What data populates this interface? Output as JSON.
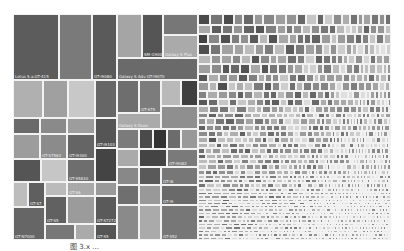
{
  "chart_data": {
    "type": "treemap",
    "title": "",
    "colorscale": "grayscale",
    "big_tiles": [
      {
        "x": 0,
        "y": 0,
        "w": 46,
        "h": 66,
        "c": "#5c5c5c",
        "label": "Lotus S.a.GT-415"
      },
      {
        "x": 46,
        "y": 0,
        "w": 33,
        "h": 66,
        "c": "#7a7a7a",
        "label": ""
      },
      {
        "x": 79,
        "y": 0,
        "w": 25,
        "h": 66,
        "c": "#5a5a5a",
        "label": "GT-i9080"
      },
      {
        "x": 104,
        "y": 0,
        "w": 25,
        "h": 44,
        "c": "#a5a5a5",
        "label": ""
      },
      {
        "x": 129,
        "y": 0,
        "w": 21,
        "h": 44,
        "c": "#555",
        "label": "SM-G9008"
      },
      {
        "x": 150,
        "y": 0,
        "w": 35,
        "h": 21,
        "c": "#777",
        "label": ""
      },
      {
        "x": 150,
        "y": 21,
        "w": 35,
        "h": 23,
        "c": "#aaa",
        "label": "Galaxy S Plus"
      },
      {
        "x": 104,
        "y": 44,
        "w": 81,
        "h": 22,
        "c": "#6a6a6a",
        "label": "Galaxy S Adv GT-I9070"
      },
      {
        "x": 0,
        "y": 66,
        "w": 30,
        "h": 38,
        "c": "#b0b0b0",
        "label": ""
      },
      {
        "x": 30,
        "y": 66,
        "w": 25,
        "h": 38,
        "c": "#a0a0a0",
        "label": ""
      },
      {
        "x": 55,
        "y": 66,
        "w": 27,
        "h": 38,
        "c": "#c8c8c8",
        "label": ""
      },
      {
        "x": 82,
        "y": 66,
        "w": 22,
        "h": 38,
        "c": "#666",
        "label": ""
      },
      {
        "x": 104,
        "y": 66,
        "w": 22,
        "h": 33,
        "c": "#6e6e6e",
        "label": ""
      },
      {
        "x": 126,
        "y": 66,
        "w": 22,
        "h": 33,
        "c": "#7c7c7c",
        "label": "GT-S75"
      },
      {
        "x": 148,
        "y": 66,
        "w": 20,
        "h": 26,
        "c": "#b9b9b9",
        "label": ""
      },
      {
        "x": 168,
        "y": 66,
        "w": 17,
        "h": 26,
        "c": "#3f3f3f",
        "label": ""
      },
      {
        "x": 0,
        "y": 104,
        "w": 27,
        "h": 16,
        "c": "#6a6a6a",
        "label": ""
      },
      {
        "x": 27,
        "y": 104,
        "w": 27,
        "h": 16,
        "c": "#8a8a8a",
        "label": ""
      },
      {
        "x": 54,
        "y": 104,
        "w": 28,
        "h": 16,
        "c": "#9d9d9d",
        "label": ""
      },
      {
        "x": 82,
        "y": 104,
        "w": 22,
        "h": 30,
        "c": "#555",
        "label": "GT-i9103"
      },
      {
        "x": 104,
        "y": 99,
        "w": 44,
        "h": 16,
        "c": "#aaa",
        "label": "Galaxy S Duos"
      },
      {
        "x": 148,
        "y": 92,
        "w": 37,
        "h": 23,
        "c": "#8f8f8f",
        "label": ""
      },
      {
        "x": 0,
        "y": 120,
        "w": 27,
        "h": 25,
        "c": "#9c9c9c",
        "label": ""
      },
      {
        "x": 27,
        "y": 120,
        "w": 27,
        "h": 25,
        "c": "#8b8b8b",
        "label": "GT-S7562"
      },
      {
        "x": 54,
        "y": 120,
        "w": 28,
        "h": 25,
        "c": "#656565",
        "label": "GT-i9300"
      },
      {
        "x": 104,
        "y": 115,
        "w": 22,
        "h": 20,
        "c": "#7b7b7b",
        "label": ""
      },
      {
        "x": 126,
        "y": 115,
        "w": 14,
        "h": 20,
        "c": "#4a4a4a",
        "label": ""
      },
      {
        "x": 140,
        "y": 115,
        "w": 14,
        "h": 20,
        "c": "#333",
        "label": ""
      },
      {
        "x": 154,
        "y": 115,
        "w": 14,
        "h": 20,
        "c": "#6c6c6c",
        "label": ""
      },
      {
        "x": 168,
        "y": 115,
        "w": 17,
        "h": 20,
        "c": "#999",
        "label": ""
      },
      {
        "x": 0,
        "y": 145,
        "w": 28,
        "h": 23,
        "c": "#555",
        "label": ""
      },
      {
        "x": 28,
        "y": 145,
        "w": 26,
        "h": 23,
        "c": "#c6c6c6",
        "label": ""
      },
      {
        "x": 54,
        "y": 145,
        "w": 28,
        "h": 23,
        "c": "#6e6e6e",
        "label": "GT-S5830"
      },
      {
        "x": 82,
        "y": 134,
        "w": 22,
        "h": 34,
        "c": "#444",
        "label": ""
      },
      {
        "x": 104,
        "y": 135,
        "w": 22,
        "h": 18,
        "c": "#aaa",
        "label": ""
      },
      {
        "x": 126,
        "y": 135,
        "w": 28,
        "h": 18,
        "c": "#444",
        "label": ""
      },
      {
        "x": 154,
        "y": 135,
        "w": 31,
        "h": 18,
        "c": "#7a7a7a",
        "label": "GT-i9082"
      },
      {
        "x": 0,
        "y": 168,
        "w": 15,
        "h": 25,
        "c": "#bdbdbd",
        "label": ""
      },
      {
        "x": 15,
        "y": 168,
        "w": 17,
        "h": 25,
        "c": "#5f5f5f",
        "label": "GT-S7"
      },
      {
        "x": 32,
        "y": 168,
        "w": 22,
        "h": 14,
        "c": "#bbb",
        "label": ""
      },
      {
        "x": 54,
        "y": 168,
        "w": 28,
        "h": 14,
        "c": "#a9a9a9",
        "label": "GT-S6"
      },
      {
        "x": 82,
        "y": 168,
        "w": 22,
        "h": 14,
        "c": "#999",
        "label": ""
      },
      {
        "x": 104,
        "y": 153,
        "w": 22,
        "h": 18,
        "c": "#888",
        "label": ""
      },
      {
        "x": 126,
        "y": 153,
        "w": 22,
        "h": 18,
        "c": "#5a5a5a",
        "label": ""
      },
      {
        "x": 148,
        "y": 153,
        "w": 37,
        "h": 18,
        "c": "#777",
        "label": "GT-I8"
      },
      {
        "x": 32,
        "y": 182,
        "w": 22,
        "h": 28,
        "c": "#616161",
        "label": "GT-S5"
      },
      {
        "x": 54,
        "y": 182,
        "w": 28,
        "h": 28,
        "c": "#9b9b9b",
        "label": ""
      },
      {
        "x": 82,
        "y": 182,
        "w": 22,
        "h": 28,
        "c": "#5a5a5a",
        "label": "GT-S7272"
      },
      {
        "x": 104,
        "y": 171,
        "w": 22,
        "h": 20,
        "c": "#6f6f6f",
        "label": ""
      },
      {
        "x": 126,
        "y": 171,
        "w": 22,
        "h": 20,
        "c": "#999",
        "label": ""
      },
      {
        "x": 148,
        "y": 171,
        "w": 37,
        "h": 20,
        "c": "#6a6a6a",
        "label": "GT-I9"
      },
      {
        "x": 0,
        "y": 193,
        "w": 32,
        "h": 33,
        "c": "#666",
        "label": "GT-N7000"
      },
      {
        "x": 32,
        "y": 210,
        "w": 30,
        "h": 16,
        "c": "#777",
        "label": ""
      },
      {
        "x": 62,
        "y": 210,
        "w": 20,
        "h": 16,
        "c": "#aaa",
        "label": ""
      },
      {
        "x": 82,
        "y": 210,
        "w": 22,
        "h": 16,
        "c": "#555",
        "label": "GT-S5"
      },
      {
        "x": 104,
        "y": 191,
        "w": 22,
        "h": 35,
        "c": "#8a8a8a",
        "label": ""
      },
      {
        "x": 126,
        "y": 191,
        "w": 22,
        "h": 35,
        "c": "#aaa",
        "label": ""
      },
      {
        "x": 148,
        "y": 191,
        "w": 37,
        "h": 35,
        "c": "#777",
        "label": "GT-S52"
      }
    ],
    "small_region": {
      "x": 185,
      "y": 0,
      "w": 193,
      "h": 226,
      "cell_min": 3,
      "cell_max": 12,
      "shade_min": 60,
      "shade_max": 220
    }
  },
  "overlay": {
    "ghost_text": ""
  },
  "caption": "图 3.x  ..."
}
